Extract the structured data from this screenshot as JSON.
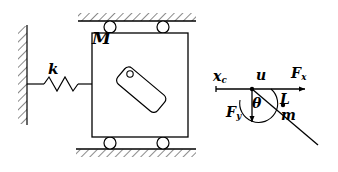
{
  "figure": {
    "width": 338,
    "height": 172,
    "stroke_color": "#000000",
    "background_color": "#ffffff"
  },
  "labels": {
    "cart_mass": "M",
    "spring_constant": "k",
    "cart_position_base": "x",
    "cart_position_sub": "c",
    "input_displacement": "u",
    "force_x_base": "F",
    "force_x_sub": "x",
    "force_y_base": "F",
    "force_y_sub": "y",
    "rod_length": "L",
    "angle": "θ",
    "pendulum_mass": "m"
  },
  "components": {
    "wall": "fixed-hatched-wall",
    "spring": "coil-spring",
    "cart": "rigid-body-block",
    "rollers": "four-rollers",
    "top_surface": "hatched-ceiling-rail",
    "bottom_surface": "hatched-ground-rail",
    "pendulum_bar": "tilted-rounded-bar",
    "pivot": "pivot-hole",
    "fbd_axis": "horizontal-reference-axis",
    "fbd_datum": "datum-tick",
    "fbd_rod": "pendulum-rod-line",
    "fbd_com": "center-of-mass-dot",
    "fbd_angle_arc": "theta-arc"
  }
}
